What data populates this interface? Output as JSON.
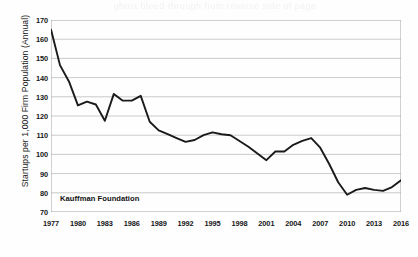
{
  "figure": {
    "background_color": "#fefefe",
    "scan_ghost_text": "ghost bleed-through from reverse side of page",
    "source_annotation": "Kauffman Foundation"
  },
  "chart_data": {
    "type": "line",
    "title": "",
    "subtitle": "",
    "xlabel": "",
    "ylabel": "Startups per 1,000 Firm Population (Annual)",
    "xlim": [
      1977,
      2016
    ],
    "ylim": [
      70,
      170
    ],
    "grid": "horizontal",
    "legend_position": "none",
    "line_color": "#1a1a1a",
    "line_width": 1.9,
    "gridline_color": "#b4b4b4",
    "axis_color": "#9a9a9a",
    "y_ticks": [
      70,
      80,
      90,
      100,
      110,
      120,
      130,
      140,
      150,
      160,
      170
    ],
    "x_ticks_labeled": [
      1977,
      1980,
      1983,
      1986,
      1989,
      1992,
      1995,
      1998,
      2001,
      2004,
      2007,
      2010,
      2013,
      2016
    ],
    "x_tick_step_minor": 1,
    "x": [
      1977,
      1978,
      1979,
      1980,
      1981,
      1982,
      1983,
      1984,
      1985,
      1986,
      1987,
      1988,
      1989,
      1990,
      1991,
      1992,
      1993,
      1994,
      1995,
      1996,
      1997,
      1998,
      1999,
      2000,
      2001,
      2002,
      2003,
      2004,
      2005,
      2006,
      2007,
      2008,
      2009,
      2010,
      2011,
      2012,
      2013,
      2014,
      2015,
      2016
    ],
    "series": [
      {
        "name": "Startups per 1,000 Firm Population",
        "values": [
          165.0,
          146.5,
          138.0,
          125.5,
          127.5,
          126.0,
          117.5,
          131.5,
          128.0,
          128.0,
          130.5,
          117.0,
          112.5,
          110.5,
          108.5,
          106.5,
          107.5,
          110.0,
          111.5,
          110.5,
          110.0,
          107.0,
          104.0,
          100.5,
          97.0,
          101.5,
          101.5,
          105.0,
          107.0,
          108.5,
          103.5,
          95.0,
          85.5,
          79.0,
          81.5,
          82.5,
          81.5,
          81.0,
          83.0,
          86.5
        ]
      }
    ]
  },
  "y_axis": {
    "title": "Startups per 1,000 Firm Population (Annual)"
  }
}
